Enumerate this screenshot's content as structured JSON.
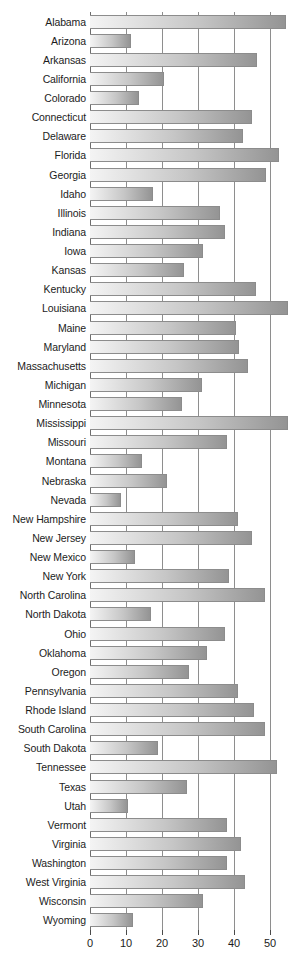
{
  "chart_data": {
    "type": "bar",
    "orientation": "horizontal",
    "title": "",
    "subtitle": "",
    "xlabel": "",
    "ylabel": "",
    "xlim": [
      0,
      55
    ],
    "xticks": [
      0,
      10,
      20,
      30,
      40,
      50
    ],
    "xtick_labels": [
      "0",
      "10",
      "20",
      "30",
      "40",
      "50"
    ],
    "grid": true,
    "legend": null,
    "bar_style": {
      "fill": "horizontal-gradient",
      "gradient_start": "#f4f4f4",
      "gradient_end": "#949494",
      "border": "#8c8c8c"
    },
    "categories": [
      "Alabama",
      "Arizona",
      "Arkansas",
      "California",
      "Colorado",
      "Connecticut",
      "Delaware",
      "Florida",
      "Georgia",
      "Idaho",
      "Illinois",
      "Indiana",
      "Iowa",
      "Kansas",
      "Kentucky",
      "Louisiana",
      "Maine",
      "Maryland",
      "Massachusetts",
      "Michigan",
      "Minnesota",
      "Mississippi",
      "Missouri",
      "Montana",
      "Nebraska",
      "Nevada",
      "New Hampshire",
      "New Jersey",
      "New Mexico",
      "New York",
      "North Carolina",
      "North Dakota",
      "Ohio",
      "Oklahoma",
      "Oregon",
      "Pennsylvania",
      "Rhode Island",
      "South Carolina",
      "South Dakota",
      "Tennessee",
      "Texas",
      "Utah",
      "Vermont",
      "Virginia",
      "Washington",
      "West Virginia",
      "Wisconsin",
      "Wyoming"
    ],
    "values": [
      54.5,
      11.5,
      46.5,
      20.5,
      13.5,
      45.0,
      42.5,
      52.5,
      49.0,
      17.5,
      36.0,
      37.5,
      31.5,
      26.0,
      46.0,
      55.0,
      40.5,
      41.5,
      44.0,
      31.0,
      25.5,
      55.0,
      38.0,
      14.5,
      21.5,
      8.5,
      41.0,
      45.0,
      12.5,
      38.5,
      48.5,
      17.0,
      37.5,
      32.5,
      27.5,
      41.0,
      45.5,
      48.5,
      19.0,
      52.0,
      27.0,
      10.5,
      38.0,
      42.0,
      38.0,
      43.0,
      31.5,
      12.0
    ]
  }
}
